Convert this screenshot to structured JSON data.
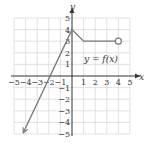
{
  "chart_data": {
    "type": "line",
    "title": "",
    "annotation": "y = f(x)",
    "xlabel": "x",
    "ylabel": "y",
    "xlim": [
      -5,
      5
    ],
    "ylim": [
      -5,
      5
    ],
    "grid": true,
    "x_ticks": [
      "−5",
      "−4",
      "−3",
      "−2",
      "−1",
      "1",
      "2",
      "3",
      "4",
      "5"
    ],
    "y_ticks": [
      "5",
      "4",
      "3",
      "2",
      "1",
      "−1",
      "−2",
      "−3",
      "−4",
      "−5"
    ],
    "series": [
      {
        "name": "f(x)",
        "points": [
          [
            -4.2,
            -4.9
          ],
          [
            0,
            4
          ],
          [
            1,
            3
          ],
          [
            4,
            3
          ]
        ],
        "start": "arrow",
        "end": "open-circle"
      }
    ],
    "colors": {
      "curve": "#777777",
      "grid": "#d9d9d9",
      "axis": "#333333"
    }
  }
}
